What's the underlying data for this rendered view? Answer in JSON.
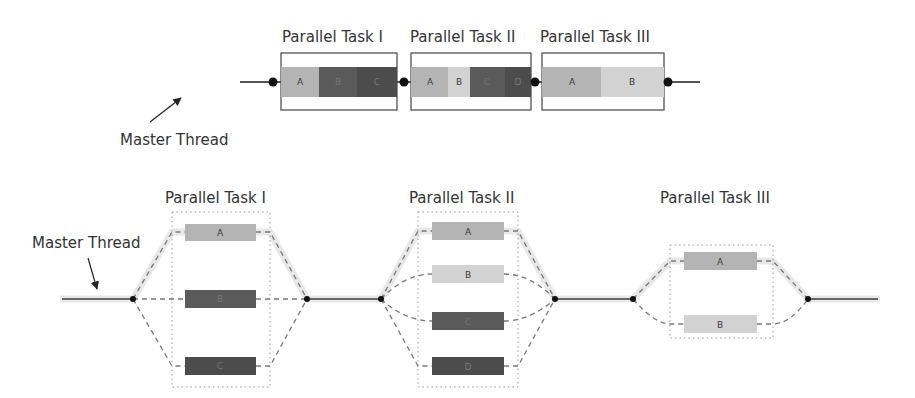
{
  "colors": {
    "light": "#b4b4b4",
    "lighter": "#d2d2d2",
    "dark": "#5a5a5a",
    "darker": "#4c4c4c",
    "line": "#555555",
    "glow": "#e6e6e6",
    "dot": "#111111"
  },
  "top_diagram": {
    "master_label": "Master Thread",
    "tasks": [
      {
        "title": "Parallel Task I",
        "segments": [
          "A",
          "B",
          "C"
        ]
      },
      {
        "title": "Parallel Task II",
        "segments": [
          "A",
          "B",
          "C",
          "D"
        ]
      },
      {
        "title": "Parallel Task III",
        "segments": [
          "A",
          "B"
        ]
      }
    ]
  },
  "bottom_diagram": {
    "master_label": "Master Thread",
    "tasks": [
      {
        "title": "Parallel Task I",
        "threads": [
          "A",
          "B",
          "C"
        ]
      },
      {
        "title": "Parallel Task II",
        "threads": [
          "A",
          "B",
          "C",
          "D"
        ]
      },
      {
        "title": "Parallel Task III",
        "threads": [
          "A",
          "B"
        ]
      }
    ]
  }
}
